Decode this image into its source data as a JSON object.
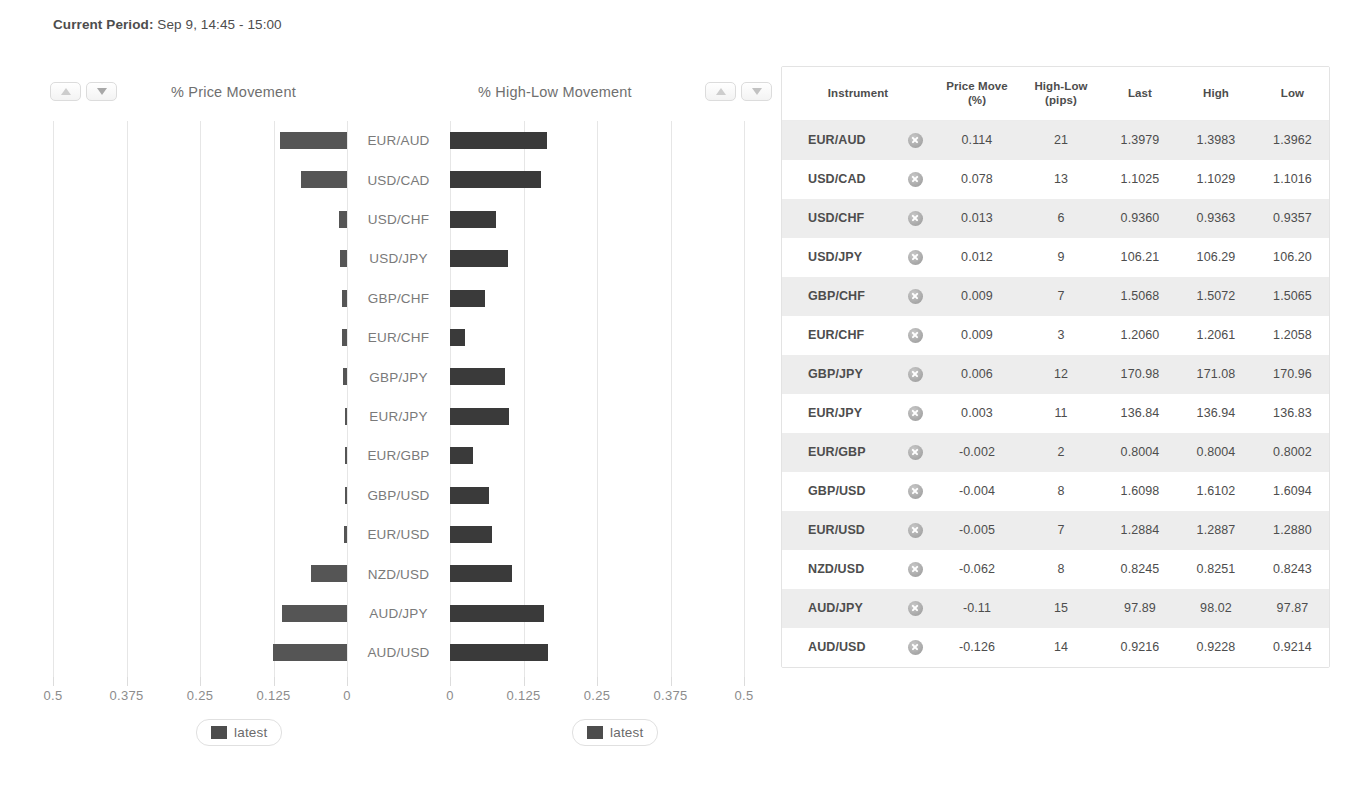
{
  "header": {
    "period_label": "Current Period:",
    "period_value": " Sep 9, 14:45 - 15:00"
  },
  "charts": {
    "left": {
      "title": "% Price Movement",
      "sort_up_icon": "triangle-up-icon",
      "sort_down_icon": "triangle-down-icon",
      "legend_label": "latest"
    },
    "right": {
      "title": "% High-Low Movement",
      "sort_up_icon": "triangle-up-icon",
      "sort_down_icon": "triangle-down-icon",
      "legend_label": "latest"
    }
  },
  "chart_data": [
    {
      "type": "bar",
      "orientation": "horizontal-left",
      "title": "% Price Movement",
      "xlabel": "",
      "ylabel": "",
      "xlim": [
        0,
        0.5
      ],
      "x_ticks": [
        0.5,
        0.375,
        0.25,
        0.125,
        0
      ],
      "x_tick_labels": [
        "0.5",
        "0.375",
        "0.25",
        "0.125",
        "0"
      ],
      "grid": true,
      "legend": [
        "latest"
      ],
      "legend_position": "bottom",
      "categories": [
        "EUR/AUD",
        "USD/CAD",
        "USD/CHF",
        "USD/JPY",
        "GBP/CHF",
        "EUR/CHF",
        "GBP/JPY",
        "EUR/JPY",
        "EUR/GBP",
        "GBP/USD",
        "EUR/USD",
        "NZD/USD",
        "AUD/JPY",
        "AUD/USD"
      ],
      "values": [
        0.114,
        0.078,
        0.013,
        0.012,
        0.009,
        0.009,
        0.006,
        0.003,
        0.002,
        0.004,
        0.005,
        0.062,
        0.11,
        0.126
      ],
      "signed_values": [
        0.114,
        0.078,
        0.013,
        0.012,
        0.009,
        0.009,
        0.006,
        0.003,
        -0.002,
        -0.004,
        -0.005,
        -0.062,
        -0.11,
        -0.126
      ]
    },
    {
      "type": "bar",
      "orientation": "horizontal-right",
      "title": "% High-Low Movement",
      "xlabel": "",
      "ylabel": "",
      "xlim": [
        0,
        0.5
      ],
      "x_ticks": [
        0,
        0.125,
        0.25,
        0.375,
        0.5
      ],
      "x_tick_labels": [
        "0",
        "0.125",
        "0.25",
        "0.375",
        "0.5"
      ],
      "grid": true,
      "legend": [
        "latest"
      ],
      "legend_position": "bottom",
      "categories": [
        "EUR/AUD",
        "USD/CAD",
        "USD/CHF",
        "USD/JPY",
        "GBP/CHF",
        "EUR/CHF",
        "GBP/JPY",
        "EUR/JPY",
        "EUR/GBP",
        "GBP/USD",
        "EUR/USD",
        "NZD/USD",
        "AUD/JPY",
        "AUD/USD"
      ],
      "values": [
        0.165,
        0.154,
        0.078,
        0.099,
        0.06,
        0.025,
        0.094,
        0.1,
        0.039,
        0.066,
        0.071,
        0.105,
        0.16,
        0.166
      ],
      "units": "percent of high-low range"
    }
  ],
  "table": {
    "columns": [
      "Instrument",
      "",
      "Price Move\n(%)",
      "High-Low\n(pips)",
      "Last",
      "High",
      "Low"
    ],
    "headers": {
      "instrument": "Instrument",
      "price_move_line1": "Price Move",
      "price_move_line2": "(%)",
      "high_low_line1": "High-Low",
      "high_low_line2": "(pips)",
      "last": "Last",
      "high": "High",
      "low": "Low"
    },
    "close_icon": "circle-x-icon",
    "rows": [
      {
        "instrument": "EUR/AUD",
        "price_move": "0.114",
        "high_low": "21",
        "last": "1.3979",
        "high": "1.3983",
        "low": "1.3962"
      },
      {
        "instrument": "USD/CAD",
        "price_move": "0.078",
        "high_low": "13",
        "last": "1.1025",
        "high": "1.1029",
        "low": "1.1016"
      },
      {
        "instrument": "USD/CHF",
        "price_move": "0.013",
        "high_low": "6",
        "last": "0.9360",
        "high": "0.9363",
        "low": "0.9357"
      },
      {
        "instrument": "USD/JPY",
        "price_move": "0.012",
        "high_low": "9",
        "last": "106.21",
        "high": "106.29",
        "low": "106.20"
      },
      {
        "instrument": "GBP/CHF",
        "price_move": "0.009",
        "high_low": "7",
        "last": "1.5068",
        "high": "1.5072",
        "low": "1.5065"
      },
      {
        "instrument": "EUR/CHF",
        "price_move": "0.009",
        "high_low": "3",
        "last": "1.2060",
        "high": "1.2061",
        "low": "1.2058"
      },
      {
        "instrument": "GBP/JPY",
        "price_move": "0.006",
        "high_low": "12",
        "last": "170.98",
        "high": "171.08",
        "low": "170.96"
      },
      {
        "instrument": "EUR/JPY",
        "price_move": "0.003",
        "high_low": "11",
        "last": "136.84",
        "high": "136.94",
        "low": "136.83"
      },
      {
        "instrument": "EUR/GBP",
        "price_move": "-0.002",
        "high_low": "2",
        "last": "0.8004",
        "high": "0.8004",
        "low": "0.8002"
      },
      {
        "instrument": "GBP/USD",
        "price_move": "-0.004",
        "high_low": "8",
        "last": "1.6098",
        "high": "1.6102",
        "low": "1.6094"
      },
      {
        "instrument": "EUR/USD",
        "price_move": "-0.005",
        "high_low": "7",
        "last": "1.2884",
        "high": "1.2887",
        "low": "1.2880"
      },
      {
        "instrument": "NZD/USD",
        "price_move": "-0.062",
        "high_low": "8",
        "last": "0.8245",
        "high": "0.8251",
        "low": "0.8243"
      },
      {
        "instrument": "AUD/JPY",
        "price_move": "-0.11",
        "high_low": "15",
        "last": "97.89",
        "high": "98.02",
        "low": "97.87"
      },
      {
        "instrument": "AUD/USD",
        "price_move": "-0.126",
        "high_low": "14",
        "last": "0.9216",
        "high": "0.9228",
        "low": "0.9214"
      }
    ]
  },
  "colors": {
    "bar": "#4d4d4d",
    "grid": "#e6e6e6",
    "row_alt": "#ededed",
    "text": "#4d4d4d"
  }
}
